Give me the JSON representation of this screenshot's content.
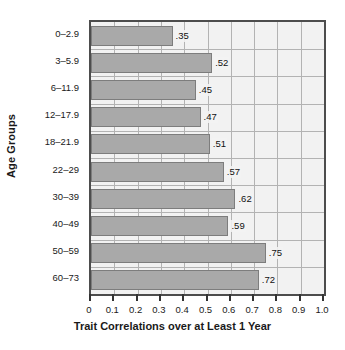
{
  "chart_data": {
    "type": "bar",
    "orientation": "horizontal",
    "title": "",
    "xlabel": "Trait Correlations over at Least 1 Year",
    "ylabel": "Age Groups",
    "categories": [
      "0–2.9",
      "3–5.9",
      "6–11.9",
      "12–17.9",
      "18–21.9",
      "22–29",
      "30–39",
      "40–49",
      "50–59",
      "60–73"
    ],
    "values": [
      0.35,
      0.52,
      0.45,
      0.47,
      0.51,
      0.57,
      0.62,
      0.59,
      0.75,
      0.72
    ],
    "value_labels": [
      ".35",
      ".52",
      ".45",
      ".47",
      ".51",
      ".57",
      ".62",
      ".59",
      ".75",
      ".72"
    ],
    "xlim": [
      0,
      1.0
    ],
    "xticks": [
      0,
      0.1,
      0.2,
      0.3,
      0.4,
      0.5,
      0.6,
      0.7,
      0.8,
      0.9,
      1.0
    ],
    "xtick_labels": [
      "0",
      "0.1",
      "0.2",
      "0.3",
      "0.4",
      "0.5",
      "0.6",
      "0.7",
      "0.8",
      "0.9",
      "1.0"
    ],
    "grid": true,
    "grid_axis": "both",
    "legend": null,
    "colors": {
      "bar_fill": "#a9a9a9",
      "bar_edge": "#7d7d7d",
      "plot_background": "#f2f2f2",
      "gridline": "#b3b3b3",
      "axis_frame": "#4d4d4d",
      "text": "#1a1a1a"
    }
  }
}
